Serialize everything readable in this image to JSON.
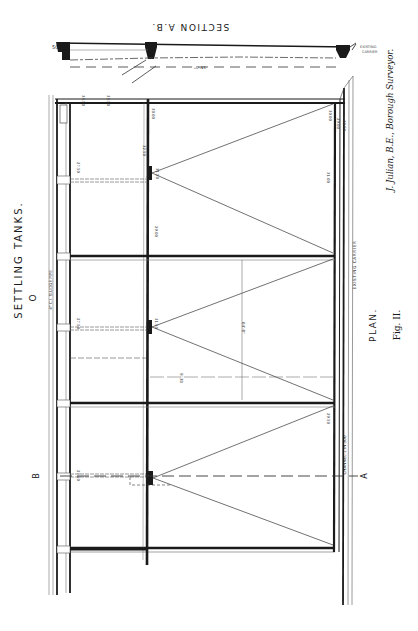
{
  "figure": {
    "section_title": "SECTION A.B.",
    "plan_title": "PLAN.",
    "main_title": "SETTLING  TANKS.",
    "fig_label": "Fig. II.",
    "credit": "J. Julian, B.E., Borough Surveyor.",
    "section_marker_a": "A",
    "section_marker_b": "B",
    "section_marker_o": "O",
    "channel_label": "CHANNEL  1 IN 300",
    "existing_label": "EXISTING  CARRIER",
    "pipe_label": "4\" C.I. SLUDGE PIPE",
    "dimension_width": "64'-8\"",
    "dimension_tank": "9'-30",
    "section_span": "15'-0\"",
    "section_left_level": "50",
    "levels": {
      "top_a": "34.50",
      "top_b": "33.50",
      "pier1_top": "30.00",
      "pier1_mid": "32.50",
      "pier1_low": "29.00",
      "right_a": "30.00",
      "right_b": "29.00",
      "right_c": "31.00",
      "right_d": "30.00",
      "mid_pier": "31.50",
      "lower_pier": "31.50",
      "channel_level": "29.50",
      "left_a": "27.50",
      "left_b": "27.50",
      "left_c": "27.50"
    }
  },
  "colors": {
    "ink": "#1a1a1a",
    "paper": "#ffffff",
    "thin": "#444444"
  }
}
